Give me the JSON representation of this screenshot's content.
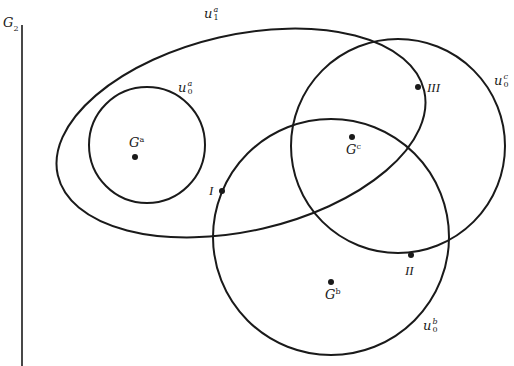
{
  "diagram": {
    "title_label": {
      "base": "G",
      "sub": "2"
    },
    "colors": {
      "stroke": "#1a1a1a",
      "background": "#ffffff"
    },
    "axis_line": {
      "x": 22,
      "y1": 25,
      "y2": 366
    },
    "shapes": [
      {
        "id": "u1a",
        "type": "ellipse",
        "label_base": "u",
        "label_sup": "a",
        "label_sub": "1",
        "cx": 241,
        "cy": 133,
        "rx": 188,
        "ry": 98,
        "rotate": -13
      },
      {
        "id": "u0a",
        "type": "circle",
        "label_base": "u",
        "label_sup": "a",
        "label_sub": "0",
        "cx": 147,
        "cy": 145,
        "r": 58
      },
      {
        "id": "u0b",
        "type": "circle",
        "label_base": "u",
        "label_sup": "b",
        "label_sub": "0",
        "cx": 331,
        "cy": 237,
        "r": 118
      },
      {
        "id": "u0c",
        "type": "circle",
        "label_base": "u",
        "label_sup": "c",
        "label_sub": "0",
        "cx": 398,
        "cy": 146,
        "r": 107
      }
    ],
    "points": [
      {
        "id": "Ga",
        "label_base": "G",
        "label_sup": "a",
        "x": 135,
        "y": 157
      },
      {
        "id": "Gc",
        "label_base": "G",
        "label_sup": "c",
        "x": 352,
        "y": 137
      },
      {
        "id": "Gb",
        "label_base": "G",
        "label_sup": "b",
        "x": 331,
        "y": 282
      },
      {
        "id": "I",
        "label": "I",
        "x": 222,
        "y": 191
      },
      {
        "id": "II",
        "label": "II",
        "x": 411,
        "y": 255
      },
      {
        "id": "III",
        "label": "III",
        "x": 418,
        "y": 87
      }
    ]
  },
  "labels": {
    "G2": {
      "base": "G",
      "sub": "2"
    },
    "u1a": {
      "base": "u",
      "sup": "a",
      "sub": "1"
    },
    "u0a": {
      "base": "u",
      "sup": "a",
      "sub": "0"
    },
    "u0b": {
      "base": "u",
      "sup": "b",
      "sub": "0"
    },
    "u0c": {
      "base": "u",
      "sup": "c",
      "sub": "0"
    },
    "Ga": {
      "base": "G",
      "sup": "a"
    },
    "Gb": {
      "base": "G",
      "sup": "b"
    },
    "Gc": {
      "base": "G",
      "sup": "c"
    },
    "I": "I",
    "II": "II",
    "III": "III"
  }
}
